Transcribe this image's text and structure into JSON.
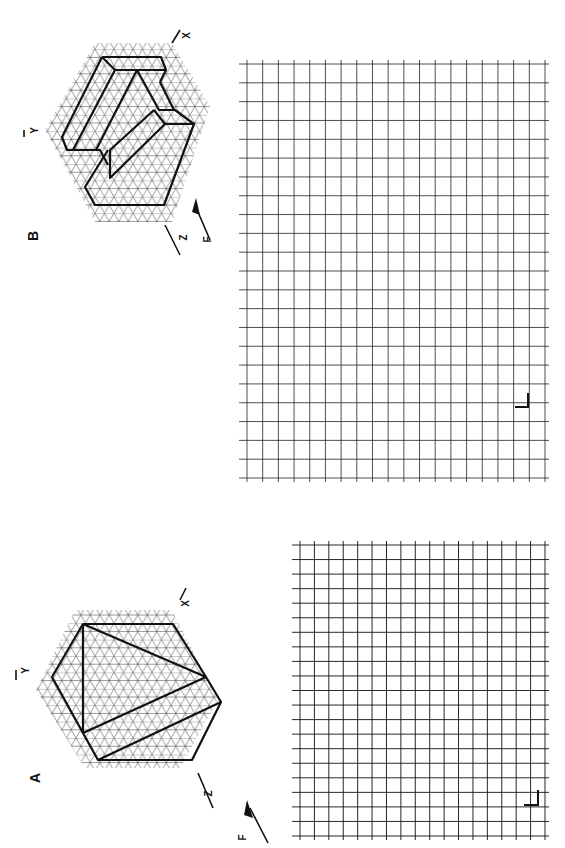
{
  "exercises": [
    {
      "id": "B",
      "label": "B",
      "axes": {
        "x": "X",
        "y": "Y",
        "z": "Z"
      },
      "view_arrow": "F",
      "grid": {
        "cols": 19,
        "rows": 22,
        "corner_mark": "L"
      }
    },
    {
      "id": "A",
      "label": "A",
      "axes": {
        "x": "X",
        "y": "Y",
        "z": "Z"
      },
      "view_arrow": "F",
      "grid": {
        "cols": 17,
        "rows": 20,
        "corner_mark": "L"
      }
    }
  ],
  "colors": {
    "line": "#111111",
    "grid_light": "#555555",
    "background": "#ffffff"
  }
}
